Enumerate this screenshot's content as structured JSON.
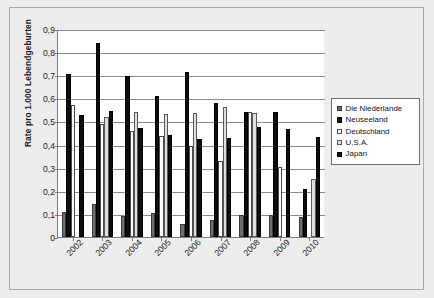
{
  "chart_data": {
    "type": "bar",
    "title": "",
    "subtitle": "",
    "xlabel": "",
    "ylabel": "Rate pro 1.000 Lebendgeburten",
    "ylim": [
      0,
      0.9
    ],
    "ytick_labels": [
      "0,9",
      "0,8",
      "0,7",
      "0,6",
      "0,5",
      "0,4",
      "0,3",
      "0,2",
      "0,1",
      "0"
    ],
    "ytick_values": [
      0.9,
      0.8,
      0.7,
      0.6,
      0.5,
      0.4,
      0.3,
      0.2,
      0.1,
      0
    ],
    "grid": true,
    "legend_position": "right",
    "decimal_separator": ",",
    "categories": [
      "2002",
      "2003",
      "2004",
      "2005",
      "2006",
      "2007",
      "2008",
      "2009",
      "2010"
    ],
    "series": [
      {
        "name": "Die Niederlande",
        "color": "#6f6f71",
        "values": [
          0.108,
          0.142,
          0.091,
          0.106,
          0.057,
          0.075,
          0.094,
          0.097,
          0.085
        ]
      },
      {
        "name": "Neuseeland",
        "color": "#0e0e0e",
        "values": [
          0.705,
          0.838,
          0.697,
          0.609,
          0.712,
          0.58,
          0.543,
          0.543,
          0.209
        ]
      },
      {
        "name": "Deutschland",
        "color": "#fcfcfc",
        "values": [
          0.57,
          0.487,
          0.459,
          0.438,
          0.393,
          0.331,
          0.543,
          0.305,
          0.0
        ]
      },
      {
        "name": "U.S.A.",
        "color": "#dedede",
        "values": [
          0.0,
          0.521,
          0.539,
          0.534,
          0.538,
          0.561,
          0.535,
          0.0,
          0.25
        ]
      },
      {
        "name": "Japan",
        "color": "#0e0e0e",
        "values": [
          0.528,
          0.544,
          0.472,
          0.441,
          0.422,
          0.43,
          0.477,
          0.467,
          0.432
        ]
      }
    ]
  },
  "legend": {
    "items": [
      {
        "label": "Die Niederlande",
        "swatch": "gray-filled"
      },
      {
        "label": "Neuseeland",
        "swatch": "black-filled"
      },
      {
        "label": "Deutschland",
        "swatch": "white-outline"
      },
      {
        "label": "U.S.A.",
        "swatch": "lightgray-outline"
      },
      {
        "label": "Japan",
        "swatch": "black-filled"
      }
    ]
  }
}
